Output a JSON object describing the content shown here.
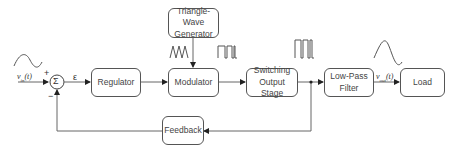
{
  "diagram": {
    "blocks": {
      "summer": "Σ",
      "regulator": "Regulator",
      "triangle_gen_line1": "Triangle-Wave",
      "triangle_gen_line2": "Generator",
      "modulator": "Modulator",
      "switching_line1": "Switching",
      "switching_line2": "Output Stage",
      "lowpass_line1": "Low-Pass",
      "lowpass_line2": "Filter",
      "load": "Load",
      "feedback": "Feedback"
    },
    "signals": {
      "input": "vin(t)",
      "input_main": "v",
      "input_sub": "in",
      "input_arg": "(t)",
      "output_main": "v",
      "output_sub": "out",
      "output_arg": "(t)",
      "error": "ε",
      "plus": "+",
      "minus": "−"
    },
    "waveforms": [
      "sine-input",
      "triangle-wave",
      "pwm-modulator-out",
      "pwm-switching-out",
      "sine-output"
    ],
    "colors": {
      "line": "#555555",
      "text": "#444444"
    }
  }
}
